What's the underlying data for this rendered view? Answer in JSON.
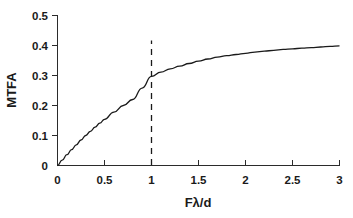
{
  "chart_data": {
    "type": "line",
    "title": "",
    "subtitle": "",
    "xlabel": "Fλ/d",
    "ylabel": "MTFA",
    "xlim": [
      0,
      3
    ],
    "ylim": [
      0,
      0.5
    ],
    "grid": false,
    "legend": null,
    "legend_position": "none",
    "x_ticks": [
      "0",
      "0.5",
      "1",
      "1.5",
      "2",
      "2.5",
      "3"
    ],
    "x_tick_values": [
      0,
      0.5,
      1,
      1.5,
      2,
      2.5,
      3
    ],
    "y_ticks": [
      "0",
      "0.1",
      "0.2",
      "0.3",
      "0.4",
      "0.5"
    ],
    "y_tick_values": [
      0,
      0.1,
      0.2,
      0.3,
      0.4,
      0.5
    ],
    "series": [
      {
        "name": "MTFA",
        "color": "#1a1a1a",
        "style": "solid",
        "x": [
          0,
          0.05,
          0.1,
          0.15,
          0.2,
          0.25,
          0.3,
          0.35,
          0.4,
          0.45,
          0.5,
          0.6,
          0.7,
          0.8,
          0.9,
          1.0,
          1.1,
          1.2,
          1.3,
          1.4,
          1.5,
          1.6,
          1.7,
          1.8,
          1.9,
          2.0,
          2.1,
          2.2,
          2.3,
          2.4,
          2.5,
          2.6,
          2.7,
          2.8,
          2.9,
          3.0
        ],
        "values": [
          0,
          0.018,
          0.036,
          0.053,
          0.069,
          0.085,
          0.1,
          0.114,
          0.128,
          0.141,
          0.154,
          0.178,
          0.2,
          0.22,
          0.258,
          0.297,
          0.311,
          0.322,
          0.331,
          0.34,
          0.348,
          0.355,
          0.361,
          0.366,
          0.37,
          0.374,
          0.378,
          0.381,
          0.384,
          0.387,
          0.389,
          0.391,
          0.393,
          0.395,
          0.397,
          0.399
        ]
      }
    ],
    "annotations": [
      {
        "type": "vertical-reference-line",
        "name": "reference-line-x1",
        "x": 1,
        "y_start": 0,
        "y_end": 0.415,
        "style": "dashed",
        "color": "#1a1a1a"
      }
    ]
  }
}
